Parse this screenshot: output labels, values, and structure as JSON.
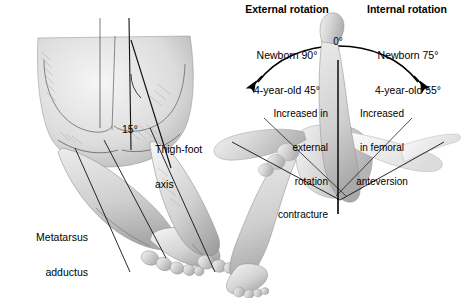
{
  "figure": {
    "type": "medical-illustration"
  },
  "left_panel": {
    "angle_label": "15°",
    "thigh_foot_axis_label": "Thigh-foot\naxis",
    "thigh_foot_axis_line1": "Thigh-foot",
    "thigh_foot_axis_line2": "axis",
    "metatarsus_label_line1": "Metatarsus",
    "metatarsus_label_line2": "adductus"
  },
  "right_panel": {
    "external": {
      "heading": "External rotation",
      "newborn": "Newborn 90°",
      "four_year_old": "4-year-old 45°"
    },
    "internal": {
      "heading": "Internal rotation",
      "newborn": "Newborn 75°",
      "four_year_old": "4-year-old 55°"
    },
    "zero_label": "0°",
    "left_annotation": {
      "line1": "Increased in",
      "line2": "external",
      "line3": "rotation",
      "line4": "contracture"
    },
    "right_annotation": {
      "line1": "Increased",
      "line2": "in femoral",
      "line3": "anteversion"
    }
  },
  "colors": {
    "ink": "#000000",
    "skin_light": "#e8e8e8",
    "skin_mid": "#c9c9c9",
    "skin_dark": "#a6a6a6",
    "background": "#ffffff"
  }
}
